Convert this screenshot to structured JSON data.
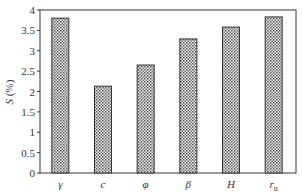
{
  "chart_data": {
    "type": "bar",
    "title": "",
    "xlabel": "",
    "ylabel": "S (%)",
    "ylabel_italic_part": "S",
    "ylabel_rest": " (%)",
    "categories": [
      "γ",
      "c",
      "φ",
      "β",
      "H",
      "r_u"
    ],
    "category_display": [
      {
        "main": "γ",
        "sub": ""
      },
      {
        "main": "c",
        "sub": ""
      },
      {
        "main": "φ",
        "sub": ""
      },
      {
        "main": "β",
        "sub": ""
      },
      {
        "main": "H",
        "sub": ""
      },
      {
        "main": "r",
        "sub": "u"
      }
    ],
    "values": [
      3.8,
      2.13,
      2.65,
      3.29,
      3.58,
      3.83
    ],
    "ylim": [
      0,
      4
    ],
    "yticks": [
      0,
      0.5,
      1,
      1.5,
      2,
      2.5,
      3,
      3.5,
      4
    ],
    "ytick_labels": [
      "0",
      "0.5",
      "1",
      "1.5",
      "2",
      "2.5",
      "3",
      "3.5",
      "4"
    ],
    "grid": false,
    "legend": null,
    "bar_fill": "dotted-pattern",
    "colors": {
      "bar_border": "#333333",
      "bar_dot": "#555555",
      "bar_bg": "#e8e8e8",
      "axis": "#333333"
    }
  }
}
